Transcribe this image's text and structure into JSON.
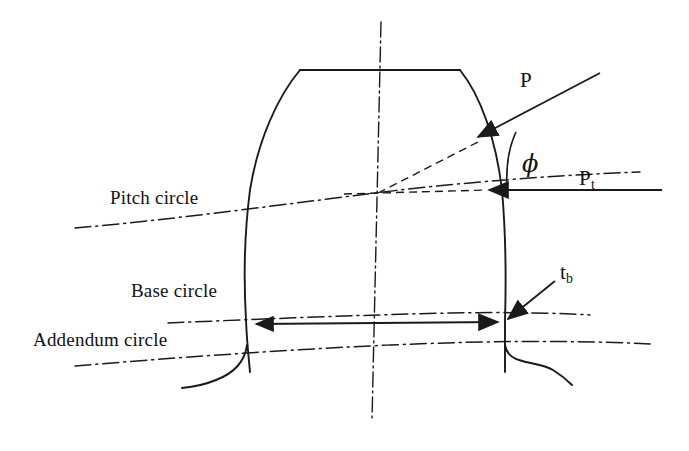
{
  "figure": {
    "background": "#ffffff",
    "stroke_color": "#1a1a1a",
    "width": 689,
    "height": 451
  },
  "labels": {
    "pitch_circle": "Pitch circle",
    "base_circle": "Base circle",
    "addendum_circle": "Addendum circle",
    "normal_force": "P",
    "tangential_force_main": "P",
    "tangential_force_sub": "t",
    "pressure_angle": "ϕ",
    "base_thickness_main": "t",
    "base_thickness_sub": "b"
  },
  "geometry": {
    "tooth": {
      "top_land": {
        "left_x": 300,
        "right_x": 460,
        "y": 70
      },
      "left_flank_path": "M 300,70 C 278,96 258,140 250,190 C 244,236 244,286 246,320 C 247,345 249,360 250,372",
      "right_flank_path": "M 460,70 C 481,96 496,140 502,190 C 506,236 506,286 505,320 C 505,345 505,360 505,372",
      "left_root_fillet": "M 246,330 C 245,352 238,370 216,380 C 204,385 192,387 182,388",
      "right_root_fillet": "M 505,330 C 506,340 509,348 518,352 C 527,356 540,358 552,365 C 560,370 566,375 570,381"
    },
    "centerline_tilted": {
      "x1": 381,
      "y1": 22,
      "x2": 372,
      "y2": 420
    },
    "pitch_point": {
      "x": 378,
      "y": 193
    },
    "arcs": {
      "pitch_circle": "M 75,228 C 180,219 300,202 400,190 C 480,181 560,175 640,172",
      "base_circle": "M 168,323 C 260,319 360,315 450,313 C 510,312 560,313 590,315",
      "addendum_circle": "M 75,366 C 170,358 280,350 390,345 C 480,341 570,340 652,344"
    },
    "force_lines": {
      "normal": {
        "x1": 470,
        "y1": 140,
        "x2": 600,
        "y2": 73,
        "arrow_at": "start"
      },
      "tangential": {
        "x1": 484,
        "y1": 190,
        "x2": 660,
        "y2": 190,
        "arrow_at": "start"
      },
      "radial_dashed": {
        "x1": 378,
        "y1": 193,
        "x2": 476,
        "y2": 143
      },
      "pitch_dashed_horizontal": {
        "x1": 378,
        "y1": 193,
        "x2": 484,
        "y2": 190
      }
    },
    "angle_arc": {
      "cx": 516,
      "cy": 190,
      "r": 58,
      "from_deg": 180,
      "to_deg": 207
    },
    "dimension_tb": {
      "x1": 250,
      "y1": 324,
      "x2": 504,
      "y2": 322
    },
    "leader_tb": {
      "x1": 512,
      "y1": 318,
      "x2": 556,
      "y2": 283
    }
  },
  "label_positions": {
    "pitch_circle": {
      "x": 110,
      "y": 188
    },
    "base_circle": {
      "x": 131,
      "y": 281
    },
    "addendum_circle": {
      "x": 33,
      "y": 330
    },
    "normal_force": {
      "x": 520,
      "y": 70
    },
    "tangential_force": {
      "x": 579,
      "y": 168
    },
    "pressure_angle": {
      "x": 522,
      "y": 152
    },
    "base_thickness": {
      "x": 560,
      "y": 262
    }
  }
}
